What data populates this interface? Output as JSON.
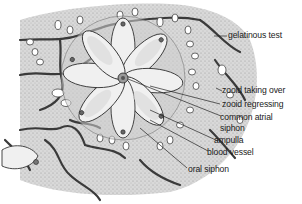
{
  "diagram": {
    "colors": {
      "ink": "#2a2a2a",
      "test_fill": "#d6d6d6",
      "zooid_fill": "#eeeeee",
      "vessel": "#3a3a3a",
      "background": "#ffffff"
    },
    "labels": [
      {
        "id": "gelatinous-test",
        "text": "gelatinous test"
      },
      {
        "id": "zooid-taking-over",
        "text": "zooid taking over"
      },
      {
        "id": "zooid-regressing",
        "text": "zooid regressing"
      },
      {
        "id": "common-atrial-siphon-1",
        "text": "common atrial"
      },
      {
        "id": "common-atrial-siphon-2",
        "text": "siphon"
      },
      {
        "id": "ampulla",
        "text": "ampulla"
      },
      {
        "id": "blood-vessel",
        "text": "blood vessel"
      },
      {
        "id": "oral-siphon",
        "text": "oral siphon"
      }
    ]
  }
}
